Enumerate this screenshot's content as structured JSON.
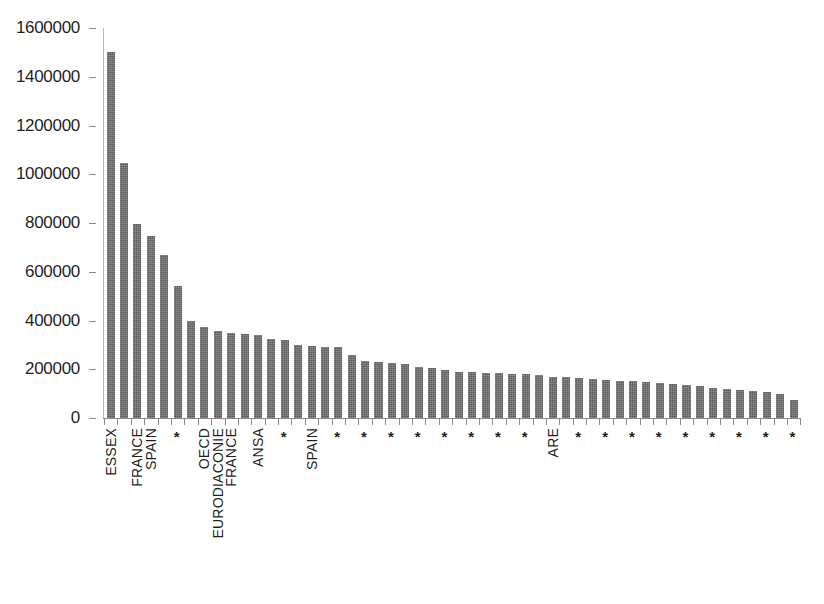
{
  "chart_data": {
    "type": "bar",
    "title": "",
    "subtitle": "",
    "xlabel": "",
    "ylabel": "",
    "ylim": [
      0,
      1600000
    ],
    "ytick_labels": [
      "1600000",
      "1400000",
      "1200000",
      "1000000",
      "800000",
      "600000",
      "400000",
      "200000",
      "0"
    ],
    "ytick_values": [
      1600000,
      1400000,
      1200000,
      1000000,
      800000,
      600000,
      400000,
      200000,
      0
    ],
    "grid": false,
    "legend": null,
    "bar_color": "#5d5d5d",
    "axis_color": "#8a8a8a",
    "categories": [
      "ESSEX",
      "",
      "FRANCE",
      "SPAIN",
      "",
      "*",
      "",
      "OECD",
      "EURODIACONIE",
      "FRANCE",
      "",
      "ANSA",
      "",
      "*",
      "",
      "SPAIN",
      "",
      "*",
      "",
      "*",
      "",
      "*",
      "",
      "*",
      "",
      "*",
      "",
      "*",
      "",
      "*",
      "",
      "*",
      "",
      "ARE",
      "",
      "*",
      "",
      "*",
      "",
      "*",
      "",
      "*",
      "",
      "*",
      "",
      "*",
      "",
      "*",
      "",
      "*",
      "",
      "*"
    ],
    "values": [
      1500000,
      1045000,
      795000,
      745000,
      670000,
      540000,
      400000,
      375000,
      355000,
      350000,
      345000,
      340000,
      325000,
      320000,
      300000,
      295000,
      290000,
      290000,
      260000,
      232000,
      230000,
      225000,
      220000,
      210000,
      205000,
      195000,
      190000,
      190000,
      185000,
      185000,
      180000,
      180000,
      175000,
      170000,
      168000,
      165000,
      160000,
      158000,
      152000,
      150000,
      148000,
      145000,
      140000,
      135000,
      130000,
      125000,
      120000,
      115000,
      110000,
      105000,
      100000,
      72000
    ]
  }
}
